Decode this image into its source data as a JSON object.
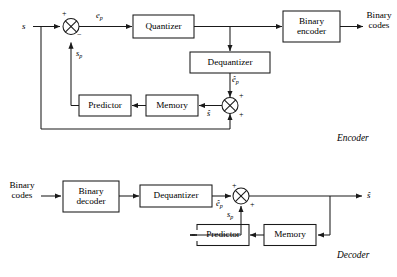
{
  "figure": {
    "type": "block-diagram",
    "background": "#ffffff",
    "stroke_color": "#1a1a1a",
    "box_fill": "#ffffff"
  },
  "sections": {
    "encoder_label": "Encoder",
    "decoder_label": "Decoder"
  },
  "encoder": {
    "input_label": "s",
    "error_label": "e",
    "error_sub": "p",
    "prediction_label": "s",
    "prediction_sub": "p",
    "dequantized_error_label": "ê",
    "dequantized_error_sub": "p",
    "reconstructed_label": "ŝ",
    "output_label_line1": "Binary",
    "output_label_line2": "codes",
    "sum1_sign_plus": "+",
    "sum1_sign_minus": "−",
    "sum2_sign_top": "+",
    "sum2_sign_bottom": "+",
    "blocks": [
      {
        "name": "quantizer",
        "line1": "Quantizer",
        "line2": ""
      },
      {
        "name": "binary-encoder",
        "line1": "Binary",
        "line2": "encoder"
      },
      {
        "name": "dequantizer",
        "line1": "Dequantizer",
        "line2": ""
      },
      {
        "name": "predictor",
        "line1": "Predictor",
        "line2": ""
      },
      {
        "name": "memory",
        "line1": "Memory",
        "line2": ""
      }
    ]
  },
  "decoder": {
    "input_label_line1": "Binary",
    "input_label_line2": "codes",
    "dequantized_error_label": "ê",
    "dequantized_error_sub": "p",
    "prediction_label": "s",
    "prediction_sub": "p",
    "output_label": "ŝ",
    "sum_sign_top": "+",
    "sum_sign_bottom": "+",
    "blocks": [
      {
        "name": "binary-decoder",
        "line1": "Binary",
        "line2": "decoder"
      },
      {
        "name": "dequantizer",
        "line1": "Dequantizer",
        "line2": ""
      },
      {
        "name": "predictor",
        "line1": "Predictor",
        "line2": ""
      },
      {
        "name": "memory",
        "line1": "Memory",
        "line2": ""
      }
    ]
  }
}
